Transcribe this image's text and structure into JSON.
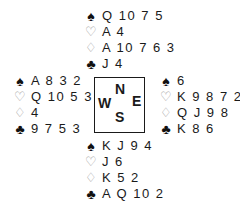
{
  "hands": {
    "north": {
      "spades": "Q 10 7 5",
      "hearts": "A 4",
      "diamonds": "A 10 7 6 3",
      "clubs": "J 4"
    },
    "west": {
      "spades": "A 8 3 2",
      "hearts": "Q 10 5 3",
      "diamonds": "4",
      "clubs": "9 7 5 3"
    },
    "east": {
      "spades": "6",
      "hearts": "K 9 8 7 2",
      "diamonds": "Q J 9 8",
      "clubs": "K 8 6"
    },
    "south": {
      "spades": "K J 9 4",
      "hearts": "J 6",
      "diamonds": "K 5 2",
      "clubs": "A Q 10 2"
    }
  },
  "suits": {
    "spades": "♠",
    "hearts": "♡",
    "diamonds": "♢",
    "clubs": "♣"
  },
  "compass": {
    "north": "N",
    "west": "W",
    "east": "E",
    "south": "S"
  }
}
